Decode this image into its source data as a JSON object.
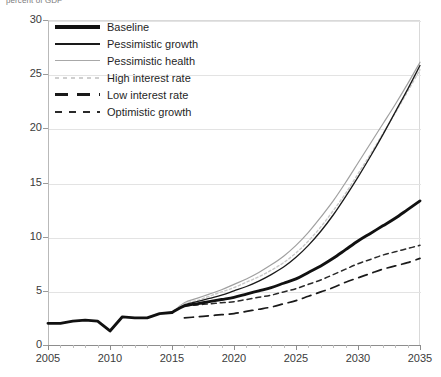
{
  "axis_caption": "percent of GDP",
  "chart_data": {
    "type": "line",
    "title": "",
    "subtitle": "",
    "xlabel": "",
    "ylabel": "percent of GDP",
    "xlim": [
      2005,
      2035
    ],
    "ylim": [
      0,
      30
    ],
    "grid": true,
    "legend_position": "top-left-inside",
    "x_ticks": [
      2005,
      2010,
      2015,
      2020,
      2025,
      2030,
      2035
    ],
    "x_minor_tick_step": 1,
    "y_ticks": [
      0,
      5,
      10,
      15,
      20,
      25,
      30
    ],
    "x_tick_labels": [
      "2005",
      "2010",
      "2015",
      "2020",
      "2025",
      "2030",
      "2035"
    ],
    "y_tick_labels": [
      "0",
      "5",
      "10",
      "15",
      "20",
      "25",
      "30"
    ],
    "historical": {
      "name": "Historical",
      "x": [
        2005,
        2006,
        2007,
        2008,
        2009,
        2010,
        2011,
        2012,
        2013,
        2014,
        2015
      ],
      "values": [
        2.0,
        2.0,
        2.2,
        2.3,
        2.2,
        1.3,
        2.6,
        2.5,
        2.5,
        2.9,
        3.0
      ]
    },
    "series": [
      {
        "name": "Baseline",
        "style": "solid-thick-black",
        "color": "#111111",
        "x": [
          2015,
          2016,
          2017,
          2018,
          2019,
          2020,
          2021,
          2022,
          2023,
          2024,
          2025,
          2026,
          2027,
          2028,
          2029,
          2030,
          2031,
          2032,
          2033,
          2034,
          2035
        ],
        "values": [
          3.0,
          3.6,
          3.8,
          4.0,
          4.2,
          4.4,
          4.7,
          5.0,
          5.3,
          5.7,
          6.1,
          6.7,
          7.3,
          8.0,
          8.8,
          9.6,
          10.3,
          11.0,
          11.7,
          12.5,
          13.3
        ]
      },
      {
        "name": "Pessimistic growth",
        "style": "solid-thin-black",
        "color": "#1a1a1a",
        "x": [
          2015,
          2016,
          2017,
          2018,
          2019,
          2020,
          2021,
          2022,
          2023,
          2024,
          2025,
          2026,
          2027,
          2028,
          2029,
          2030,
          2031,
          2032,
          2033,
          2034,
          2035
        ],
        "values": [
          3.0,
          3.7,
          4.0,
          4.3,
          4.6,
          5.0,
          5.4,
          5.9,
          6.5,
          7.2,
          8.1,
          9.2,
          10.5,
          12.0,
          13.7,
          15.5,
          17.4,
          19.4,
          21.5,
          23.6,
          25.8
        ]
      },
      {
        "name": "Pessimistic health",
        "style": "solid-thin-gray",
        "color": "#a0a0a0",
        "x": [
          2015,
          2016,
          2017,
          2018,
          2019,
          2020,
          2021,
          2022,
          2023,
          2024,
          2025,
          2026,
          2027,
          2028,
          2029,
          2030,
          2031,
          2032,
          2033,
          2034,
          2035
        ],
        "values": [
          3.0,
          3.9,
          4.3,
          4.7,
          5.1,
          5.6,
          6.1,
          6.7,
          7.4,
          8.2,
          9.2,
          10.4,
          11.8,
          13.3,
          15.0,
          16.8,
          18.6,
          20.4,
          22.2,
          24.1,
          26.1
        ]
      },
      {
        "name": "High interest rate",
        "style": "dotted-light-gray",
        "color": "#c8c8c8",
        "x": [
          2015,
          2016,
          2017,
          2018,
          2019,
          2020,
          2021,
          2022,
          2023,
          2024,
          2025,
          2026,
          2027,
          2028,
          2029,
          2030,
          2031,
          2032,
          2033,
          2034,
          2035
        ],
        "values": [
          3.0,
          3.8,
          4.1,
          4.5,
          4.9,
          5.3,
          5.8,
          6.3,
          6.9,
          7.6,
          8.5,
          9.6,
          10.9,
          12.4,
          14.0,
          15.8,
          17.6,
          19.5,
          21.4,
          23.4,
          25.4
        ]
      },
      {
        "name": "Low interest rate",
        "style": "dashed-long-black",
        "color": "#1a1a1a",
        "x": [
          2016,
          2017,
          2018,
          2019,
          2020,
          2021,
          2022,
          2023,
          2024,
          2025,
          2026,
          2027,
          2028,
          2029,
          2030,
          2031,
          2032,
          2033,
          2034,
          2035
        ],
        "values": [
          2.5,
          2.6,
          2.7,
          2.8,
          2.9,
          3.1,
          3.3,
          3.5,
          3.8,
          4.1,
          4.5,
          4.9,
          5.3,
          5.8,
          6.2,
          6.6,
          7.0,
          7.3,
          7.6,
          8.0
        ]
      },
      {
        "name": "Optimistic growth",
        "style": "dashed-short-black",
        "color": "#2a2a2a",
        "x": [
          2016,
          2017,
          2018,
          2019,
          2020,
          2021,
          2022,
          2023,
          2024,
          2025,
          2026,
          2027,
          2028,
          2029,
          2030,
          2031,
          2032,
          2033,
          2034,
          2035
        ],
        "values": [
          3.6,
          3.7,
          3.8,
          3.9,
          4.0,
          4.2,
          4.4,
          4.6,
          4.9,
          5.2,
          5.6,
          6.0,
          6.5,
          7.0,
          7.5,
          7.9,
          8.3,
          8.6,
          8.9,
          9.2
        ]
      }
    ]
  },
  "legend": {
    "items": [
      {
        "label": "Baseline"
      },
      {
        "label": "Pessimistic growth"
      },
      {
        "label": "Pessimistic health"
      },
      {
        "label": "High interest rate"
      },
      {
        "label": "Low interest rate"
      },
      {
        "label": "Optimistic growth"
      }
    ]
  }
}
